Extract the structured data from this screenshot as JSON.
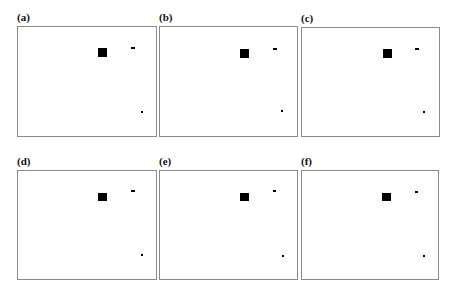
{
  "figure": {
    "panels": [
      {
        "label": "(a)",
        "left": 17,
        "top": 26,
        "width": 140,
        "height": 111,
        "square": {
          "x": 98,
          "y": 48,
          "w": 9,
          "h": 9
        },
        "dash": {
          "x": 131,
          "y": 47,
          "w": 4,
          "h": 2
        },
        "dot": {
          "x": 141,
          "y": 111,
          "w": 2,
          "h": 2
        }
      },
      {
        "label": "(b)",
        "left": 159,
        "top": 26,
        "width": 139,
        "height": 111,
        "square": {
          "x": 240,
          "y": 49,
          "w": 9,
          "h": 9
        },
        "dash": {
          "x": 273,
          "y": 48,
          "w": 4,
          "h": 2
        },
        "dot": {
          "x": 281,
          "y": 110,
          "w": 2,
          "h": 2
        }
      },
      {
        "label": "(c)",
        "left": 301,
        "top": 27,
        "width": 139,
        "height": 110,
        "square": {
          "x": 383,
          "y": 49,
          "w": 9,
          "h": 9
        },
        "dash": {
          "x": 415,
          "y": 48,
          "w": 4,
          "h": 2
        },
        "dot": {
          "x": 423,
          "y": 111,
          "w": 2,
          "h": 2
        }
      },
      {
        "label": "(d)",
        "left": 17,
        "top": 170,
        "width": 140,
        "height": 110,
        "square": {
          "x": 98,
          "y": 193,
          "w": 9,
          "h": 8
        },
        "dash": {
          "x": 131,
          "y": 190,
          "w": 4,
          "h": 2
        },
        "dot": {
          "x": 141,
          "y": 254,
          "w": 2,
          "h": 2
        }
      },
      {
        "label": "(e)",
        "left": 159,
        "top": 170,
        "width": 139,
        "height": 110,
        "square": {
          "x": 240,
          "y": 193,
          "w": 9,
          "h": 8
        },
        "dash": {
          "x": 273,
          "y": 190,
          "w": 3,
          "h": 2
        },
        "dot": {
          "x": 282,
          "y": 255,
          "w": 2,
          "h": 2
        }
      },
      {
        "label": "(f)",
        "left": 301,
        "top": 170,
        "width": 138,
        "height": 110,
        "square": {
          "x": 382,
          "y": 193,
          "w": 9,
          "h": 8
        },
        "dash": {
          "x": 415,
          "y": 191,
          "w": 3,
          "h": 2
        },
        "dot": {
          "x": 423,
          "y": 255,
          "w": 2,
          "h": 2
        }
      }
    ],
    "colors": {
      "frame": "#8a8a8a",
      "marks": "#000000",
      "background": "#ffffff"
    }
  }
}
